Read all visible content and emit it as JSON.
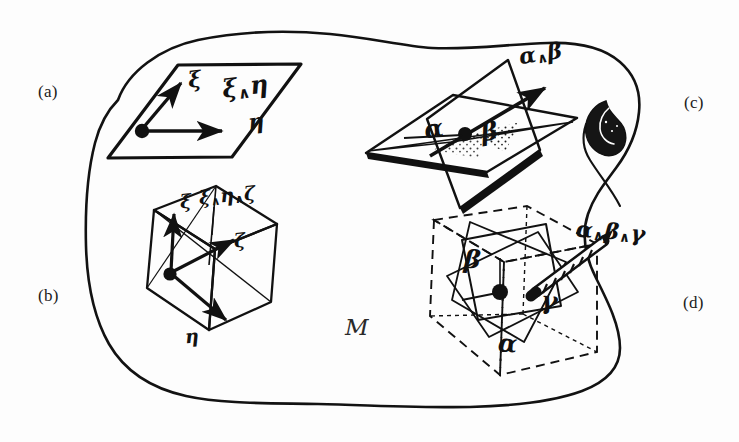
{
  "figure": {
    "manifold_label": "M",
    "background_color": "#fdfdfd",
    "ink_color": "#111111",
    "width": 739,
    "height": 442
  },
  "panels": [
    {
      "id": "a",
      "index_label": "(a)",
      "description": "Parallelogram spanned by two vectors at a point",
      "labels": [
        {
          "name": "vector-xi",
          "text": "ξ"
        },
        {
          "name": "vector-eta",
          "text": "η"
        },
        {
          "name": "bivector-xi-eta",
          "lhs": "ξ",
          "wedge": "∧",
          "rhs": "η"
        }
      ]
    },
    {
      "id": "b",
      "index_label": "(b)",
      "description": "Parallelepiped spanned by three vectors at a point",
      "labels": [
        {
          "name": "vector-xi",
          "text": "ξ"
        },
        {
          "name": "vector-eta",
          "text": "η"
        },
        {
          "name": "vector-zeta",
          "text": "ζ"
        },
        {
          "name": "trivector-xi-eta-zeta",
          "lhs": "ξ",
          "wedge": "∧",
          "mid": "η",
          "wedge2": "∧",
          "rhs": "ζ"
        }
      ]
    },
    {
      "id": "c",
      "index_label": "(c)",
      "description": "Two intersecting covector planes and their wedge product",
      "labels": [
        {
          "name": "form-alpha",
          "text": "α"
        },
        {
          "name": "form-beta",
          "text": "β"
        },
        {
          "name": "two-form-alpha-beta",
          "lhs": "α",
          "wedge": "∧",
          "rhs": "β"
        }
      ]
    },
    {
      "id": "d",
      "index_label": "(d)",
      "description": "Three intersecting covector planes in a dashed cube and their wedge product",
      "labels": [
        {
          "name": "form-alpha",
          "text": "α"
        },
        {
          "name": "form-beta",
          "text": "β"
        },
        {
          "name": "form-gamma",
          "text": "γ"
        },
        {
          "name": "three-form-alpha-beta-gamma",
          "lhs": "α",
          "wedge": "∧",
          "mid": "β",
          "wedge2": "∧",
          "rhs": "γ"
        }
      ]
    }
  ]
}
